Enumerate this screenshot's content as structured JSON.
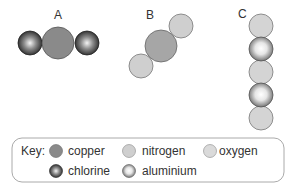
{
  "molecules": [
    {
      "label": "A",
      "atoms": [
        "chlorine",
        "copper",
        "chlorine"
      ]
    },
    {
      "label": "B",
      "atoms": [
        "nitrogen",
        "copper",
        "nitrogen"
      ]
    },
    {
      "label": "C",
      "atoms": [
        "oxygen",
        "aluminium",
        "oxygen",
        "aluminium",
        "oxygen"
      ]
    }
  ],
  "key": {
    "title": "Key:",
    "items": [
      {
        "name": "copper",
        "color": "#8a8a8a"
      },
      {
        "name": "nitrogen",
        "color": "#c8c8c8"
      },
      {
        "name": "oxygen",
        "color": "#d6d6d6"
      },
      {
        "name": "chlorine",
        "color": "#3a3a3a"
      },
      {
        "name": "aluminium",
        "color": "#f0f0f0"
      }
    ]
  }
}
